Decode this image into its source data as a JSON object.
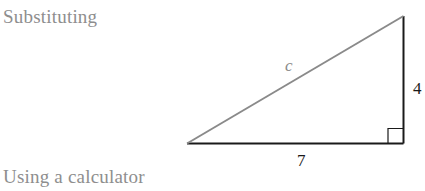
{
  "text": {
    "before_figure": "Substituting",
    "after_figure": "Using a calculator"
  },
  "figure": {
    "type": "right-triangle",
    "labels": {
      "hypotenuse": "c",
      "vertical_leg": "4",
      "horizontal_leg": "7"
    },
    "right_angle_marker": "bottom-right",
    "colors": {
      "legs": "#1a1a1a",
      "hypotenuse": "#8a8a8a",
      "hypotenuse_label": "#8a8a8a",
      "leg_labels": "#1a1a1a"
    }
  }
}
